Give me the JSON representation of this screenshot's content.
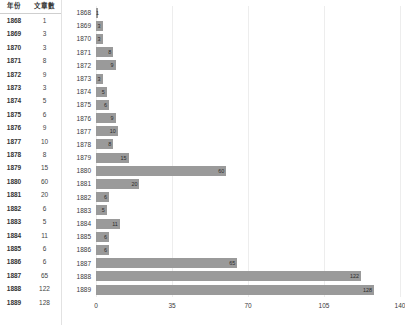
{
  "table": {
    "headers": {
      "year": "年份",
      "count": "文章數"
    },
    "rows": [
      {
        "year": "1868",
        "count": "1"
      },
      {
        "year": "1869",
        "count": "3"
      },
      {
        "year": "1870",
        "count": "3"
      },
      {
        "year": "1871",
        "count": "8"
      },
      {
        "year": "1872",
        "count": "9"
      },
      {
        "year": "1873",
        "count": "3"
      },
      {
        "year": "1874",
        "count": "5"
      },
      {
        "year": "1875",
        "count": "6"
      },
      {
        "year": "1876",
        "count": "9"
      },
      {
        "year": "1877",
        "count": "10"
      },
      {
        "year": "1878",
        "count": "8"
      },
      {
        "year": "1879",
        "count": "15"
      },
      {
        "year": "1880",
        "count": "60"
      },
      {
        "year": "1881",
        "count": "20"
      },
      {
        "year": "1882",
        "count": "6"
      },
      {
        "year": "1883",
        "count": "5"
      },
      {
        "year": "1884",
        "count": "11"
      },
      {
        "year": "1885",
        "count": "6"
      },
      {
        "year": "1886",
        "count": "6"
      },
      {
        "year": "1887",
        "count": "65"
      },
      {
        "year": "1888",
        "count": "122"
      },
      {
        "year": "1889",
        "count": "128"
      }
    ]
  },
  "chart_data": {
    "type": "bar",
    "orientation": "horizontal",
    "title": "",
    "xlabel": "",
    "ylabel": "",
    "categories": [
      "1868",
      "1869",
      "1870",
      "1871",
      "1872",
      "1873",
      "1874",
      "1875",
      "1876",
      "1877",
      "1878",
      "1879",
      "1880",
      "1881",
      "1882",
      "1883",
      "1884",
      "1885",
      "1886",
      "1887",
      "1888",
      "1889"
    ],
    "values": [
      1,
      3,
      3,
      8,
      9,
      3,
      5,
      6,
      9,
      10,
      8,
      15,
      60,
      20,
      6,
      5,
      11,
      6,
      6,
      65,
      122,
      128
    ],
    "xlim": [
      0,
      140
    ],
    "xticks": [
      "0",
      "35",
      "70",
      "105",
      "140"
    ],
    "xtick_values": [
      0,
      35,
      70,
      105,
      140
    ],
    "grid": true,
    "legend": null,
    "bar_color": "#9a9a9a",
    "data_labels": true,
    "label_color": "#2a2a2a"
  }
}
